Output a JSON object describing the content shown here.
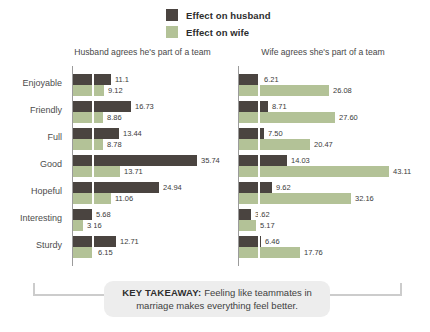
{
  "legend": {
    "items": [
      {
        "label": "Effect on husband",
        "color": "#4a4440"
      },
      {
        "label": "Effect on wife",
        "color": "#b3c297"
      }
    ]
  },
  "chart_data": {
    "type": "bar",
    "orientation": "horizontal",
    "categories": [
      "Enjoyable",
      "Friendly",
      "Full",
      "Good",
      "Hopeful",
      "Interesting",
      "Sturdy"
    ],
    "grid": "single faint white vertical gridline near axis",
    "legend_position": "top-center",
    "panels": [
      {
        "title": "Husband agrees he's part of a team",
        "xlim": [
          0,
          40
        ],
        "series": [
          {
            "name": "Effect on husband",
            "values": [
              11.1,
              16.73,
              13.44,
              35.74,
              24.94,
              5.68,
              12.71
            ],
            "labels": [
              "11.1",
              "16.73",
              "13.44",
              "35.74",
              "24.94",
              "5.68",
              "12.71"
            ]
          },
          {
            "name": "Effect on wife",
            "values": [
              9.12,
              8.86,
              8.78,
              13.71,
              11.06,
              3.16,
              6.15
            ],
            "labels": [
              "9.12",
              "8.86",
              "8.78",
              "13.71",
              "11.06",
              "3.16",
              "6.15"
            ]
          }
        ]
      },
      {
        "title": "Wife agrees she's part of a team",
        "xlim": [
          0,
          45
        ],
        "series": [
          {
            "name": "Effect on husband",
            "values": [
              6.21,
              8.71,
              7.5,
              14.03,
              9.62,
              3.62,
              6.46
            ],
            "labels": [
              "6.21",
              "8.71",
              "7.50",
              "14.03",
              "9.62",
              "3.62",
              "6.46"
            ]
          },
          {
            "name": "Effect on wife",
            "values": [
              26.08,
              27.6,
              20.47,
              43.11,
              32.16,
              5.17,
              17.76
            ],
            "labels": [
              "26.08",
              "27.60",
              "20.47",
              "43.11",
              "32.16",
              "5.17",
              "17.76"
            ]
          }
        ]
      }
    ]
  },
  "takeaway": {
    "label_bold": "KEY TAKEAWAY:",
    "text": "Feeling like teammates in marriage makes everything feel better."
  },
  "colors": {
    "background": "#ffffff",
    "husband_bar": "#4a4440",
    "wife_bar": "#b3c297",
    "axis": "#9b9b9b",
    "category_label": "#4d4d4d",
    "value_label": "#3b3b3b",
    "panel_title": "#484848",
    "takeaway_bg": "#ededed",
    "bracket": "#cccccc"
  }
}
